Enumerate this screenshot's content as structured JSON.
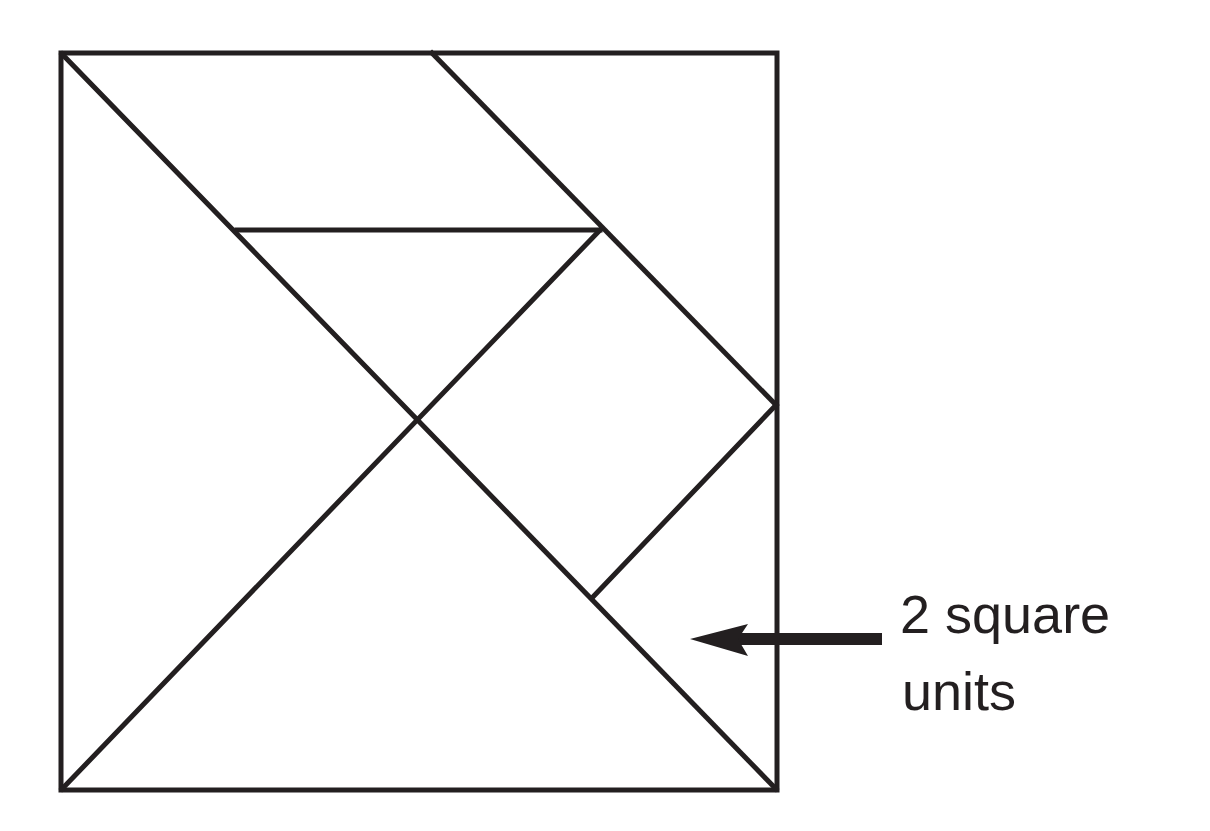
{
  "diagram": {
    "type": "tangram",
    "stroke_color": "#231f20",
    "background": "#ffffff",
    "square": {
      "x1": 60,
      "y1": 52,
      "x2": 778,
      "y2": 791
    },
    "lines": [
      {
        "name": "diagonal-main",
        "x1": 62,
        "y1": 54,
        "x2": 776,
        "y2": 789
      },
      {
        "name": "diagonal-anti-lower",
        "x1": 62,
        "y1": 789,
        "x2": 600,
        "y2": 230
      },
      {
        "name": "top-slant",
        "x1": 432,
        "y1": 53,
        "x2": 776,
        "y2": 405
      },
      {
        "name": "parallelogram-bottom",
        "x1": 237,
        "y1": 230,
        "x2": 600,
        "y2": 230
      },
      {
        "name": "small-square-edge",
        "x1": 776,
        "y1": 405,
        "x2": 592,
        "y2": 598
      }
    ],
    "arrow": {
      "x_tail": 880,
      "x_head": 690,
      "y": 639,
      "color": "#231f20"
    },
    "label": {
      "line1": "2 square",
      "line2": "units"
    }
  }
}
